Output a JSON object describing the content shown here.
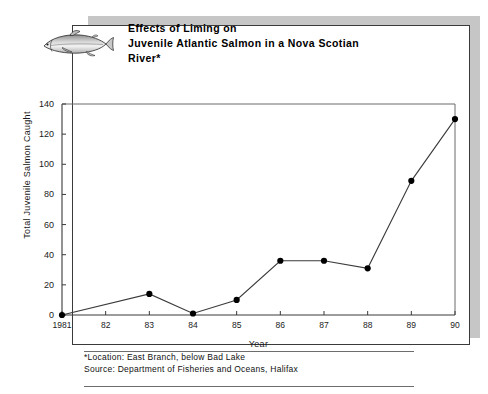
{
  "figure": {
    "title_line1": "Effects of Liming on",
    "title_line2": "Juvenile Atlantic Salmon in a Nova Scotian River*",
    "fish_icon_name": "salmon-fish-icon",
    "footnotes": [
      "*Location: East Branch, below Bad Lake",
      "Source: Department of Fisheries and Oceans, Halifax"
    ],
    "colors": {
      "line": "#3a3a3a",
      "marker": "#000000",
      "frame": "#3a3a3a",
      "shadow": "#c6c6c6",
      "background": "#ffffff"
    }
  },
  "chart_data": {
    "type": "line",
    "title": "Effects of Liming on Juvenile Atlantic Salmon in a Nova Scotian River*",
    "xlabel": "Year",
    "ylabel": "Total Juvenile Salmon Caught",
    "x": [
      1981,
      1982,
      1983,
      1984,
      1985,
      1986,
      1987,
      1988,
      1989,
      1990
    ],
    "categories": [
      "1981",
      "82",
      "83",
      "84",
      "85",
      "86",
      "87",
      "88",
      "89",
      "90"
    ],
    "values": [
      0,
      null,
      14,
      1,
      10,
      36,
      36,
      31,
      89,
      130
    ],
    "markers_shown": [
      true,
      false,
      true,
      true,
      true,
      true,
      true,
      true,
      true,
      true
    ],
    "xlim": [
      1981,
      1990
    ],
    "ylim": [
      0,
      140
    ],
    "yticks": [
      0,
      20,
      40,
      60,
      80,
      100,
      120,
      140
    ],
    "ytick_labels": [
      "0",
      "20",
      "40",
      "60",
      "80",
      "100",
      "120",
      "140"
    ],
    "xtick_labels": [
      "1981",
      "82",
      "83",
      "84",
      "85",
      "86",
      "87",
      "88",
      "89",
      "90"
    ],
    "grid": false,
    "legend": null,
    "marker_style": "filled-circle",
    "series": [
      {
        "name": "Total Juvenile Salmon Caught",
        "values": [
          0,
          null,
          14,
          1,
          10,
          36,
          36,
          31,
          89,
          130
        ]
      }
    ]
  }
}
